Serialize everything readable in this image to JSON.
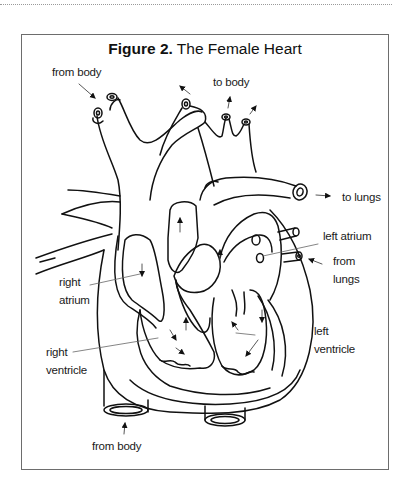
{
  "figure": {
    "number_label": "Figure 2.",
    "title": "The Female Heart"
  },
  "labels": {
    "from_body_top": "from body",
    "to_body": "to body",
    "to_lungs": "to lungs",
    "left_atrium": "left atrium",
    "from_lungs": "from\nlungs",
    "from_lungs_line1": "from",
    "from_lungs_line2": "lungs",
    "right_atrium_line1": "right",
    "right_atrium_line2": "atrium",
    "left_ventricle_line1": "left",
    "left_ventricle_line2": "ventricle",
    "right_ventricle_line1": "right",
    "right_ventricle_line2": "ventricle",
    "from_body_bottom": "from body"
  },
  "colors": {
    "line": "#111111",
    "leader": "#555555",
    "frame": "#6d6d6d"
  }
}
